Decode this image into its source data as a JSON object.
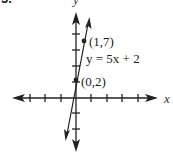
{
  "problem_number": "5.",
  "axes": {
    "x_label": "x",
    "y_label": "y"
  },
  "equation": "y = 5x + 2",
  "points": [
    {
      "label": "(0,2)",
      "x": 0,
      "y": 2
    },
    {
      "label": "(1,7)",
      "x": 1,
      "y": 7
    }
  ],
  "colors": {
    "ink": "#222222",
    "background": "#ffffff"
  }
}
